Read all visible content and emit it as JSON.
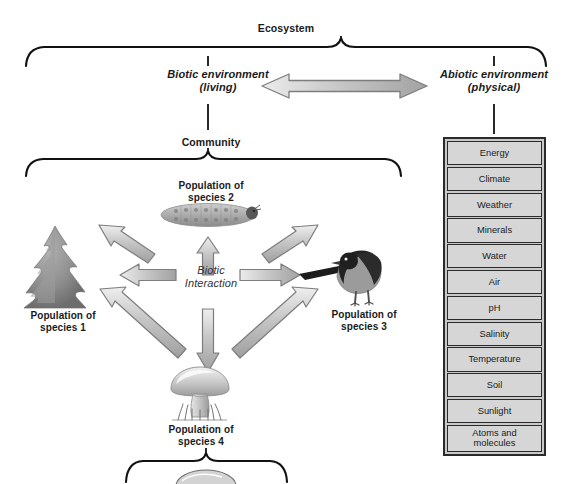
{
  "diagram": {
    "title": "Ecosystem",
    "ecosystem_label": "Ecosystem",
    "biotic_label": "Biotic environment\n(living)",
    "abiotic_label": "Abiotic environment\n(physical)",
    "community_label": "Community",
    "interaction_label": "Biotic\nInteraction",
    "populations": [
      {
        "id": "species-1",
        "label": "Population of\nspecies 1",
        "organism": "conifer-tree-icon"
      },
      {
        "id": "species-2",
        "label": "Population of\nspecies 2",
        "organism": "caterpillar-icon"
      },
      {
        "id": "species-3",
        "label": "Population of\nspecies 3",
        "organism": "bird-icon"
      },
      {
        "id": "species-4",
        "label": "Population of\nspecies 4",
        "organism": "mushroom-icon"
      }
    ],
    "abiotic_factors": [
      "Energy",
      "Climate",
      "Weather",
      "Minerals",
      "Water",
      "Air",
      "pH",
      "Salinity",
      "Temperature",
      "Soil",
      "Sunlight",
      "Atoms and\nmolecules"
    ],
    "colors": {
      "arrow_fill": "#c0c0c0",
      "arrow_stroke": "#8a8a8a",
      "box_fill": "#d6d6d6",
      "box_stroke": "#2b2b2b",
      "panel_fill": "#c9c9c9",
      "brace_stroke": "#111111",
      "text": "#1a1a1a"
    }
  }
}
